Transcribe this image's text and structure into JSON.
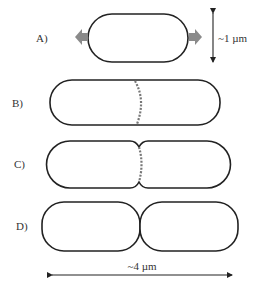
{
  "diagram": {
    "colors": {
      "outline": "#222222",
      "growth_arrow": "#8a8a8a",
      "septum": "#777777",
      "label": "#333333"
    },
    "panels": [
      {
        "id": "A",
        "label": "A)",
        "description": "cell elongating, growth arrows both ends"
      },
      {
        "id": "B",
        "label": "B)",
        "description": "elongated cell with forming septum ring"
      },
      {
        "id": "C",
        "label": "C)",
        "description": "constriction at midcell"
      },
      {
        "id": "D",
        "label": "D)",
        "description": "two daughter cells separated"
      }
    ],
    "scale_width": {
      "label": "~1 µm",
      "orientation": "vertical"
    },
    "scale_length": {
      "label": "~4 µm",
      "orientation": "horizontal"
    }
  }
}
